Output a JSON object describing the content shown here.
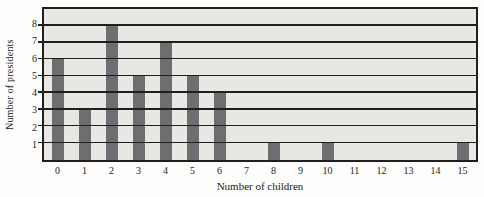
{
  "chart_data": {
    "type": "bar",
    "xlabel": "Number of children",
    "ylabel": "Number of presidents",
    "categories": [
      "0",
      "1",
      "2",
      "3",
      "4",
      "5",
      "6",
      "7",
      "8",
      "9",
      "10",
      "11",
      "12",
      "13",
      "14",
      "15"
    ],
    "values": [
      6,
      3,
      8,
      5,
      7,
      5,
      4,
      0,
      1,
      0,
      1,
      0,
      0,
      0,
      0,
      1
    ],
    "ylim": [
      0,
      9
    ],
    "yticks": [
      1,
      2,
      3,
      4,
      5,
      6,
      7,
      8
    ],
    "grid": "horizontal",
    "gridlines_drawn_over_bars": true,
    "legend_position": "none"
  },
  "colors": {
    "bar": "#6e6e70",
    "line": "#1f1f1f",
    "plot_background": "#e8e7e4",
    "page_background": "#fdfdfb",
    "text": "#1c1c1c"
  }
}
